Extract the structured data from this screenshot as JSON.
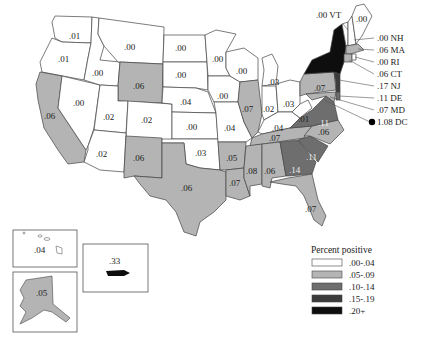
{
  "map": {
    "title": "",
    "legend": {
      "title": "Percent positive",
      "classes": [
        {
          "label": ".00-.04",
          "color": "#ffffff"
        },
        {
          "label": ".05-.09",
          "color": "#b4b4b4"
        },
        {
          "label": ".10-.14",
          "color": "#6e6e6e"
        },
        {
          "label": ".15-.19",
          "color": "#3c3c3c"
        },
        {
          "label": ".20+",
          "color": "#0e0e0e"
        }
      ]
    },
    "states": {
      "WA": ".01",
      "OR": ".01",
      "ID": ".00",
      "MT": ".00",
      "WY": ".06",
      "CA": ".06",
      "NV": ".00",
      "UT": ".02",
      "CO": ".02",
      "AZ": ".02",
      "NM": ".06",
      "ND": ".00",
      "SD": ".00",
      "NE": ".04",
      "KS": ".00",
      "OK": ".03",
      "TX": ".06",
      "MN": ".00",
      "IA": ".00",
      "MO": ".04",
      "AR": ".05",
      "LA": ".07",
      "WI": ".00",
      "IL": ".07",
      "MI": ".03",
      "IN": ".02",
      "OH": ".03",
      "KY": ".04",
      "TN": ".07",
      "MS": ".08",
      "AL": ".06",
      "GA": ".14",
      "FL": ".07",
      "SC": ".11",
      "NC": ".06",
      "VA": ".11",
      "WV": ".01",
      "PA": ".07",
      "NY": "",
      "ME": ".00",
      "HI": ".04",
      "AK": ".05",
      "PR": ".33"
    },
    "callouts": [
      {
        "state": "VT",
        "text": ".00 VT"
      },
      {
        "state": "NH",
        "text": ".00 NH"
      },
      {
        "state": "MA",
        "text": ".06 MA"
      },
      {
        "state": "RI",
        "text": ".00 RI"
      },
      {
        "state": "CT",
        "text": ".06 CT"
      },
      {
        "state": "NJ",
        "text": ".17 NJ"
      },
      {
        "state": "DE",
        "text": ".11 DE"
      },
      {
        "state": "MD",
        "text": ".07 MD"
      },
      {
        "state": "DC",
        "text": "1.08 DC"
      }
    ]
  }
}
